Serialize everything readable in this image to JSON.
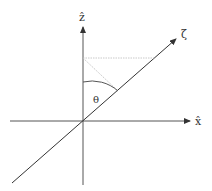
{
  "diagram": {
    "type": "coordinate-axes",
    "axes": {
      "z": {
        "label": "ẑ",
        "direction": "up"
      },
      "x": {
        "label": "x̂",
        "direction": "right"
      },
      "zeta": {
        "label": "ζ",
        "direction": "up-right"
      }
    },
    "angle": {
      "label": "θ",
      "between": [
        "z",
        "zeta"
      ]
    },
    "projection_lines": {
      "horizontal": "dotted, from z-axis to zeta line",
      "diagonal": "dotted, from z-axis to zeta line"
    },
    "colors": {
      "axis": "#444444",
      "zeta_line": "#333333",
      "dotted": "#bbbbbb",
      "text": "#333333"
    }
  }
}
